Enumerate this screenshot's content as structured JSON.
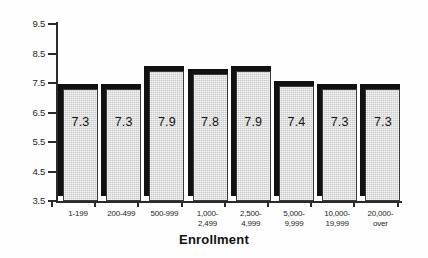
{
  "chart_data": {
    "type": "bar",
    "title": "",
    "subtitle": "",
    "xlabel": "Enrollment",
    "ylabel": "",
    "categories": [
      "1-199",
      "200-499",
      "500-999",
      "1,000-\n2,499",
      "2,500-\n4,999",
      "5,000-\n9,999",
      "10,000-\n19,999",
      "20,000-\nover"
    ],
    "values": [
      7.3,
      7.3,
      7.9,
      7.8,
      7.9,
      7.4,
      7.3,
      7.3
    ],
    "value_labels": [
      "7.3",
      "7.3",
      "7.9",
      "7.8",
      "7.9",
      "7.4",
      "7.3",
      "7.3"
    ],
    "ylim": [
      3.5,
      9.5
    ],
    "ytick_labels": [
      "9.5",
      "8.5",
      "7.5",
      "6.5",
      "5.5",
      "4.5",
      "3.5"
    ],
    "ytick_values": [
      9.5,
      8.5,
      7.5,
      6.5,
      5.5,
      4.5,
      3.5
    ],
    "grid": false,
    "legend": false,
    "legend_position": "none",
    "bar_style": "3d-shadow",
    "colors": {
      "bar_face": "#c9c9c9",
      "bar_shadow": "#111111",
      "bar_outline": "#3a3a3a",
      "axis": "#2b2b2b",
      "text": "#1a1a1a",
      "background": "#ffffff"
    }
  }
}
